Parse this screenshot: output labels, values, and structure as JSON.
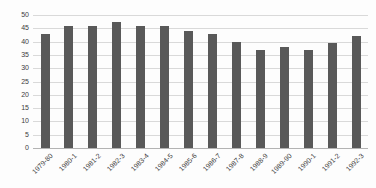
{
  "chart_data": {
    "type": "bar",
    "title": "",
    "xlabel": "",
    "ylabel": "",
    "categories": [
      "1979-80",
      "1980-1",
      "1981-2",
      "1982-3",
      "1983-4",
      "1984-5",
      "1985-6",
      "1986-7",
      "1987-8",
      "1988-9",
      "1989-90",
      "1990-1",
      "1991-2",
      "1992-3"
    ],
    "values": [
      43,
      46,
      46,
      47.5,
      46,
      46,
      44,
      43,
      40,
      37,
      38,
      37,
      39.5,
      42
    ],
    "ylim": [
      0,
      50
    ],
    "yticks": [
      0,
      5,
      10,
      15,
      20,
      25,
      30,
      35,
      40,
      45,
      50
    ],
    "grid": true,
    "legend": false,
    "bar_color": "#595959",
    "gridline_color": "#d9d9d9",
    "axis_line_color": "#b3b3b3",
    "text_color": "#404040"
  }
}
